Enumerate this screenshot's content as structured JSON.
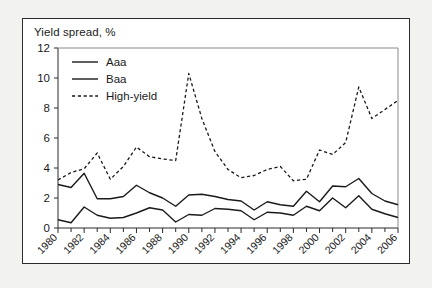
{
  "figure": {
    "title": "Yield spread, %",
    "background_color": "#ffffff",
    "page_color": "#f2f2f0",
    "border_color": "#2b2b2b"
  },
  "chart_data": {
    "type": "line",
    "title": "Yield spread, %",
    "xlabel": "",
    "ylabel": "Yield spread, %",
    "ylim": [
      0,
      12
    ],
    "xlim": [
      1980,
      2006
    ],
    "yticks": [
      0,
      2,
      4,
      6,
      8,
      10,
      12
    ],
    "ytick_labels": [
      "0",
      "2",
      "4",
      "6",
      "8",
      "10",
      "12"
    ],
    "xticks": [
      1980,
      1982,
      1984,
      1986,
      1988,
      1990,
      1992,
      1994,
      1996,
      1998,
      2000,
      2002,
      2004,
      2006
    ],
    "xtick_labels": [
      "1980",
      "1982",
      "1984",
      "1986",
      "1988",
      "1990",
      "1992",
      "1994",
      "1996",
      "1998",
      "2000",
      "2002",
      "2004",
      "2006"
    ],
    "x_minor_ticks_every": 1,
    "grid": false,
    "legend_position": "top-left",
    "x": [
      1980,
      1981,
      1982,
      1983,
      1984,
      1985,
      1986,
      1987,
      1988,
      1989,
      1990,
      1991,
      1992,
      1993,
      1994,
      1995,
      1996,
      1997,
      1998,
      1999,
      2000,
      2001,
      2002,
      2003,
      2004,
      2005,
      2006
    ],
    "series": [
      {
        "name": "Aaa",
        "style": "solid",
        "color": "#1a1a1a",
        "values": [
          0.55,
          0.35,
          1.4,
          0.85,
          0.65,
          0.7,
          1.0,
          1.35,
          1.2,
          0.4,
          0.9,
          0.85,
          1.3,
          1.25,
          1.15,
          0.55,
          1.05,
          1.0,
          0.85,
          1.45,
          1.15,
          2.0,
          1.35,
          2.15,
          1.25,
          0.95,
          0.7
        ]
      },
      {
        "name": "Baa",
        "style": "solid",
        "color": "#1a1a1a",
        "values": [
          2.9,
          2.7,
          3.65,
          1.95,
          1.95,
          2.1,
          2.85,
          2.35,
          2.0,
          1.45,
          2.2,
          2.25,
          2.1,
          1.9,
          1.8,
          1.2,
          1.75,
          1.55,
          1.45,
          2.45,
          1.75,
          2.8,
          2.75,
          3.3,
          2.3,
          1.8,
          1.55
        ]
      },
      {
        "name": "High-yield",
        "style": "dashed",
        "color": "#1a1a1a",
        "values": [
          3.2,
          3.7,
          3.95,
          5.0,
          3.25,
          4.1,
          5.4,
          4.75,
          4.6,
          4.5,
          10.3,
          7.3,
          5.1,
          3.9,
          3.35,
          3.5,
          3.9,
          4.1,
          3.15,
          3.25,
          5.2,
          4.9,
          5.7,
          9.4,
          7.3,
          7.9,
          8.5
        ]
      }
    ],
    "annotations": {
      "high_yield_peak_1990": 10.3,
      "high_yield_peak_2002": 9.4,
      "high_yield_peak_2003": 8.5
    }
  },
  "legend": {
    "items": [
      {
        "label": "Aaa",
        "style": "solid"
      },
      {
        "label": "Baa",
        "style": "solid"
      },
      {
        "label": "High-yield",
        "style": "dashed"
      }
    ]
  }
}
